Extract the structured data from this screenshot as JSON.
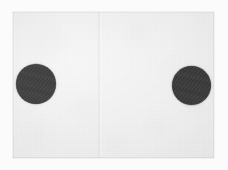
{
  "scan": {
    "title": "Scanned sheet with two printed dots",
    "surround_color": "#fbfbfb",
    "paper_color": "#eeefee",
    "paper_label": "paper-sheet",
    "has_visible_text": false,
    "text_content": ""
  },
  "paper": {
    "left": 13,
    "top": 12,
    "width": 201,
    "height": 146,
    "fold": {
      "label": "vertical fold crease",
      "orientation": "vertical",
      "x": 99
    }
  },
  "marks": [
    {
      "id": "dot-left",
      "label": "left dot",
      "shape": "circle",
      "color": "#414141",
      "center_x": 36,
      "center_y": 84,
      "diameter": 40
    },
    {
      "id": "dot-right",
      "label": "right dot",
      "shape": "circle",
      "color": "#3a3a3a",
      "center_x": 191,
      "center_y": 85,
      "diameter": 39
    }
  ],
  "meta": {
    "mark_count": "2",
    "canvas_width": "228",
    "canvas_height": "170"
  }
}
